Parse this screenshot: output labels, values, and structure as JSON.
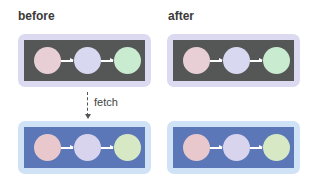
{
  "titles": {
    "before": "before",
    "after": "after"
  },
  "fetch": {
    "label": "fetch"
  },
  "colors": {
    "dark_outer": "#dcdaf0",
    "dark_inner": "#555756",
    "blue_outer": "#cfe2f6",
    "blue_inner": "#5b77b8",
    "node_1_dark": "#e8cfd6",
    "node_2_dark": "#d8d9f0",
    "node_3_dark": "#c9ebcf",
    "node_1_blue": "#e8c8cc",
    "node_2_blue": "#d9d4ee",
    "node_3_blue": "#d6e9c4",
    "arrow": "#ffffff"
  },
  "panels": [
    {
      "id": "before-top",
      "theme": "dark",
      "nodes": [
        "node-1",
        "node-2",
        "node-3"
      ],
      "edges": [
        "node-1→node-2",
        "node-2→node-3"
      ]
    },
    {
      "id": "after-top",
      "theme": "dark",
      "nodes": [
        "node-1",
        "node-2",
        "node-3"
      ],
      "edges": [
        "node-1→node-2",
        "node-2→node-3"
      ]
    },
    {
      "id": "before-bottom",
      "theme": "blue",
      "nodes": [
        "node-1",
        "node-2",
        "node-3"
      ],
      "edges": [
        "node-1→node-2",
        "node-2→node-3"
      ]
    },
    {
      "id": "after-bottom",
      "theme": "blue",
      "nodes": [
        "node-1",
        "node-2",
        "node-3"
      ],
      "edges": [
        "node-1→node-2",
        "node-2→node-3"
      ]
    }
  ]
}
